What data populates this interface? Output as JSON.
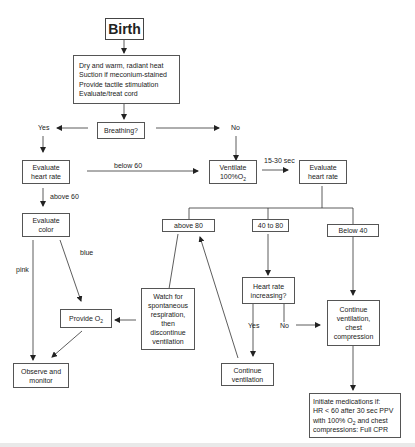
{
  "diagram": {
    "nodes": {
      "birth": "Birth",
      "initial_steps": "Dry and  warm, radiant heat\nSuction if meconium-stained\nProvide tactile stimulation\nEvaluate/treat cord",
      "breathing": "Breathing?",
      "eval_hr_left": "Evaluate\nheart rate",
      "ventilate_prefix": "Ventilate\n100%O",
      "ventilate_sub": "2",
      "eval_hr_right": "Evaluate\nheart rate",
      "eval_color": "Evaluate\ncolor",
      "above_80": "above 80",
      "range_40_80": "40 to 80",
      "below_40": "Below 40",
      "watch_spontaneous": "Watch for\nspontaneous\nrespiration,\nthen\ndiscontinue\nventilation",
      "provide_o2_prefix": "Provide O",
      "provide_o2_sub": "2",
      "hr_increasing": "Heart rate\nincreasing?",
      "continue_vent_chest": "Continue\nventilation,\nchest\ncompression",
      "observe_monitor": "Observe and\nmonitor",
      "continue_ventilation": "Continue\nventilation",
      "initiate_meds_line1": "Initiate medications if:",
      "initiate_meds_line2": "HR < 60 after 30 sec PPV",
      "initiate_meds_line3_prefix": "with 100% O",
      "initiate_meds_line3_sub": "2",
      "initiate_meds_line3_suffix": " and chest",
      "initiate_meds_line4": "compressions: Full CPR"
    },
    "edge_labels": {
      "yes": "Yes",
      "no": "No",
      "below_60": "below 60",
      "above_60": "above 60",
      "interval": "15-30 sec",
      "pink": "pink",
      "blue": "blue",
      "yes_hr": "Yes",
      "no_hr": "No"
    },
    "colors": {
      "line": "#333333",
      "box_border": "#555555",
      "text": "#222222",
      "background": "#ffffff"
    }
  }
}
